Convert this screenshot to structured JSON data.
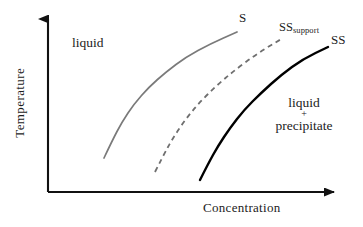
{
  "figure": {
    "kind": "schematic-phase-diagram",
    "background_color": "#ffffff"
  },
  "axes": {
    "y_title": "Temperature",
    "x_title": "Concentration",
    "axis_color": "#111111",
    "origin": [
      48,
      192
    ],
    "y_top": [
      48,
      10
    ],
    "x_right": [
      345,
      192
    ],
    "ticks": [],
    "grid": false
  },
  "labels": {
    "curve_s": "S",
    "curve_ss_support_main": "SS",
    "curve_ss_support_sub": "support",
    "curve_ss": "SS",
    "region_liquid": "liquid",
    "region_precipitate_line1": "liquid",
    "region_precipitate_line2": "+",
    "region_precipitate_line3": "precipitate"
  },
  "chart_data": {
    "type": "line",
    "title": "",
    "xlabel": "Concentration",
    "ylabel": "Temperature",
    "xlim": [
      0,
      1
    ],
    "ylim": [
      0,
      1
    ],
    "grid": false,
    "legend": "inline-curve-labels",
    "axis_ticks_shown": false,
    "series": [
      {
        "name": "S",
        "label": "S",
        "style": "solid",
        "color": "#7a7a7a",
        "width": 1.7,
        "points": [
          [
            104,
            158
          ],
          [
            112,
            141
          ],
          [
            122,
            122
          ],
          [
            134,
            104
          ],
          [
            149,
            87
          ],
          [
            166,
            72
          ],
          [
            186,
            57
          ],
          [
            210,
            44
          ],
          [
            237,
            32
          ]
        ]
      },
      {
        "name": "SS_support",
        "label": "SS support",
        "style": "dashed",
        "dash_pattern": "5,4",
        "color": "#6f6f6f",
        "width": 1.8,
        "points": [
          [
            155,
            172
          ],
          [
            163,
            156
          ],
          [
            173,
            138
          ],
          [
            185,
            120
          ],
          [
            199,
            103
          ],
          [
            216,
            86
          ],
          [
            235,
            70
          ],
          [
            258,
            53
          ],
          [
            283,
            38
          ]
        ]
      },
      {
        "name": "SS",
        "label": "SS",
        "style": "solid",
        "color": "#000000",
        "width": 2.4,
        "points": [
          [
            200,
            180
          ],
          [
            208,
            164
          ],
          [
            218,
            146
          ],
          [
            230,
            128
          ],
          [
            244,
            110
          ],
          [
            261,
            93
          ],
          [
            281,
            75
          ],
          [
            303,
            59
          ],
          [
            328,
            47
          ]
        ]
      }
    ],
    "annotations": [
      {
        "text": "liquid",
        "x": 95,
        "y": 45
      },
      {
        "text": "liquid + precipitate",
        "x": 304,
        "y": 115
      },
      {
        "text": "S",
        "x": 243,
        "y": 18
      },
      {
        "text": "SSsupport",
        "x": 300,
        "y": 28
      },
      {
        "text": "SS",
        "x": 338,
        "y": 40
      }
    ]
  }
}
